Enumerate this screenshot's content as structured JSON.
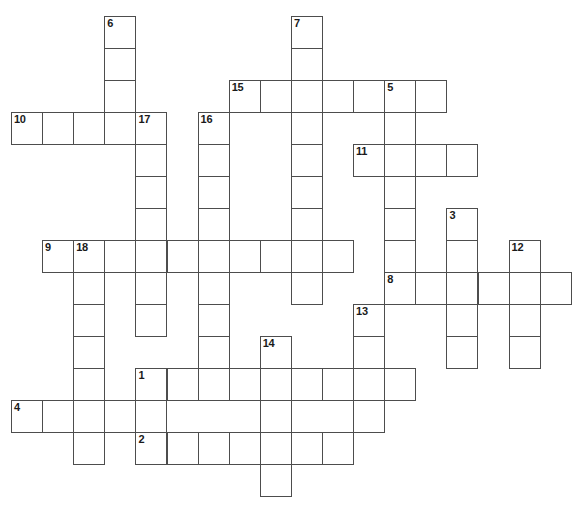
{
  "page": {
    "kind": "crossword-puzzle-grid",
    "width": 579,
    "height": 515,
    "background": "#ffffff"
  },
  "grid": {
    "origin_x": 11,
    "origin_y": 16,
    "cell_width": 31.1,
    "cell_height": 32,
    "columns": 18,
    "rows": 15,
    "line_color": "#4d4d4d",
    "cell_background": "#ffffff",
    "number_color": "#1a1a1a",
    "cells": [
      {
        "c": 3,
        "r": 0,
        "n": "6"
      },
      {
        "c": 9,
        "r": 0,
        "n": "7"
      },
      {
        "c": 3,
        "r": 1
      },
      {
        "c": 9,
        "r": 1
      },
      {
        "c": 3,
        "r": 2
      },
      {
        "c": 7,
        "r": 2,
        "n": "15"
      },
      {
        "c": 8,
        "r": 2
      },
      {
        "c": 9,
        "r": 2
      },
      {
        "c": 10,
        "r": 2
      },
      {
        "c": 11,
        "r": 2
      },
      {
        "c": 12,
        "r": 2,
        "n": "5"
      },
      {
        "c": 13,
        "r": 2
      },
      {
        "c": 0,
        "r": 3,
        "n": "10"
      },
      {
        "c": 1,
        "r": 3
      },
      {
        "c": 2,
        "r": 3
      },
      {
        "c": 3,
        "r": 3
      },
      {
        "c": 4,
        "r": 3,
        "n": "17"
      },
      {
        "c": 6,
        "r": 3,
        "n": "16"
      },
      {
        "c": 9,
        "r": 3
      },
      {
        "c": 12,
        "r": 3
      },
      {
        "c": 4,
        "r": 4
      },
      {
        "c": 6,
        "r": 4
      },
      {
        "c": 9,
        "r": 4
      },
      {
        "c": 11,
        "r": 4,
        "n": "11"
      },
      {
        "c": 12,
        "r": 4
      },
      {
        "c": 13,
        "r": 4
      },
      {
        "c": 14,
        "r": 4
      },
      {
        "c": 4,
        "r": 5
      },
      {
        "c": 6,
        "r": 5
      },
      {
        "c": 9,
        "r": 5
      },
      {
        "c": 12,
        "r": 5
      },
      {
        "c": 4,
        "r": 6
      },
      {
        "c": 6,
        "r": 6
      },
      {
        "c": 9,
        "r": 6
      },
      {
        "c": 12,
        "r": 6
      },
      {
        "c": 14,
        "r": 6,
        "n": "3"
      },
      {
        "c": 1,
        "r": 7,
        "n": "9"
      },
      {
        "c": 2,
        "r": 7,
        "n": "18"
      },
      {
        "c": 3,
        "r": 7
      },
      {
        "c": 4,
        "r": 7
      },
      {
        "c": 5,
        "r": 7
      },
      {
        "c": 6,
        "r": 7
      },
      {
        "c": 7,
        "r": 7
      },
      {
        "c": 8,
        "r": 7
      },
      {
        "c": 9,
        "r": 7
      },
      {
        "c": 10,
        "r": 7
      },
      {
        "c": 12,
        "r": 7
      },
      {
        "c": 14,
        "r": 7
      },
      {
        "c": 16,
        "r": 7,
        "n": "12"
      },
      {
        "c": 2,
        "r": 8
      },
      {
        "c": 4,
        "r": 8
      },
      {
        "c": 6,
        "r": 8
      },
      {
        "c": 9,
        "r": 8
      },
      {
        "c": 12,
        "r": 8,
        "n": "8"
      },
      {
        "c": 13,
        "r": 8
      },
      {
        "c": 14,
        "r": 8
      },
      {
        "c": 15,
        "r": 8
      },
      {
        "c": 16,
        "r": 8
      },
      {
        "c": 17,
        "r": 8
      },
      {
        "c": 2,
        "r": 9
      },
      {
        "c": 4,
        "r": 9
      },
      {
        "c": 6,
        "r": 9
      },
      {
        "c": 11,
        "r": 9,
        "n": "13"
      },
      {
        "c": 14,
        "r": 9
      },
      {
        "c": 16,
        "r": 9
      },
      {
        "c": 2,
        "r": 10
      },
      {
        "c": 6,
        "r": 10
      },
      {
        "c": 8,
        "r": 10,
        "n": "14"
      },
      {
        "c": 11,
        "r": 10
      },
      {
        "c": 14,
        "r": 10
      },
      {
        "c": 16,
        "r": 10
      },
      {
        "c": 2,
        "r": 11
      },
      {
        "c": 4,
        "r": 11,
        "n": "1"
      },
      {
        "c": 5,
        "r": 11
      },
      {
        "c": 6,
        "r": 11
      },
      {
        "c": 7,
        "r": 11
      },
      {
        "c": 8,
        "r": 11
      },
      {
        "c": 9,
        "r": 11
      },
      {
        "c": 10,
        "r": 11
      },
      {
        "c": 11,
        "r": 11
      },
      {
        "c": 12,
        "r": 11
      },
      {
        "c": 0,
        "r": 12,
        "n": "4"
      },
      {
        "c": 1,
        "r": 12
      },
      {
        "c": 2,
        "r": 12
      },
      {
        "c": 3,
        "r": 12
      },
      {
        "c": 4,
        "r": 12
      },
      {
        "c": 8,
        "r": 12
      },
      {
        "c": 11,
        "r": 12
      },
      {
        "c": 2,
        "r": 13
      },
      {
        "c": 4,
        "r": 13,
        "n": "2"
      },
      {
        "c": 5,
        "r": 13
      },
      {
        "c": 6,
        "r": 13
      },
      {
        "c": 7,
        "r": 13
      },
      {
        "c": 8,
        "r": 13
      },
      {
        "c": 9,
        "r": 13
      },
      {
        "c": 10,
        "r": 13
      },
      {
        "c": 8,
        "r": 14
      }
    ],
    "entries": [
      {
        "number": "1",
        "direction": "across",
        "row": 11,
        "col": 4,
        "length": 9
      },
      {
        "number": "2",
        "direction": "across",
        "row": 13,
        "col": 4,
        "length": 7
      },
      {
        "number": "3",
        "direction": "down",
        "row": 6,
        "col": 14,
        "length": 5
      },
      {
        "number": "4",
        "direction": "across",
        "row": 12,
        "col": 0,
        "length": 5
      },
      {
        "number": "5",
        "direction": "down",
        "row": 2,
        "col": 12,
        "length": 7
      },
      {
        "number": "6",
        "direction": "down",
        "row": 0,
        "col": 3,
        "length": 4
      },
      {
        "number": "7",
        "direction": "down",
        "row": 0,
        "col": 9,
        "length": 9
      },
      {
        "number": "8",
        "direction": "across",
        "row": 8,
        "col": 12,
        "length": 6
      },
      {
        "number": "9",
        "direction": "across",
        "row": 7,
        "col": 1,
        "length": 10
      },
      {
        "number": "10",
        "direction": "across",
        "row": 3,
        "col": 0,
        "length": 5
      },
      {
        "number": "11",
        "direction": "across",
        "row": 4,
        "col": 11,
        "length": 4
      },
      {
        "number": "12",
        "direction": "down",
        "row": 7,
        "col": 16,
        "length": 4
      },
      {
        "number": "13",
        "direction": "down",
        "row": 9,
        "col": 11,
        "length": 4
      },
      {
        "number": "14",
        "direction": "down",
        "row": 10,
        "col": 8,
        "length": 5
      },
      {
        "number": "15",
        "direction": "across",
        "row": 2,
        "col": 7,
        "length": 7
      },
      {
        "number": "16",
        "direction": "down",
        "row": 3,
        "col": 6,
        "length": 9
      },
      {
        "number": "17",
        "direction": "down",
        "row": 3,
        "col": 4,
        "length": 7
      },
      {
        "number": "18",
        "direction": "down",
        "row": 7,
        "col": 2,
        "length": 7
      }
    ]
  }
}
